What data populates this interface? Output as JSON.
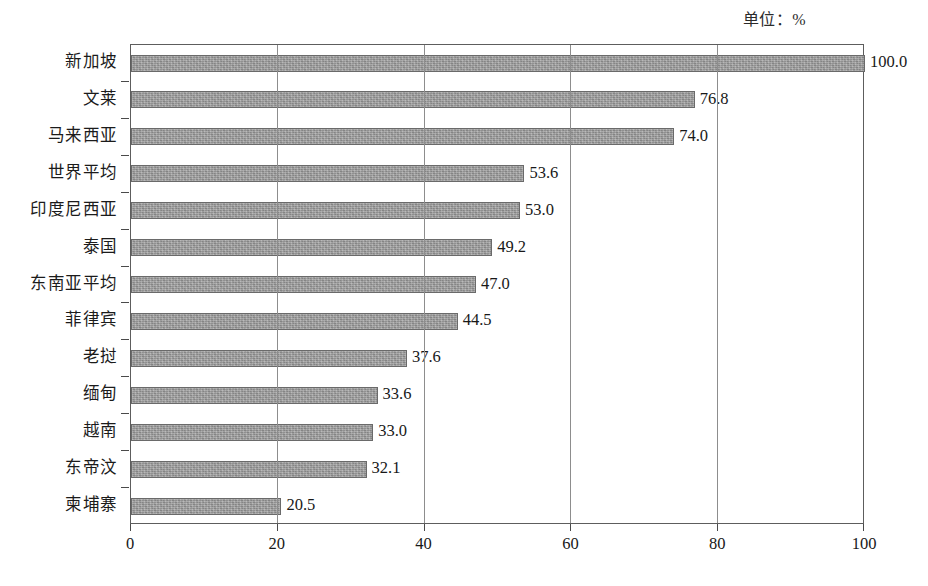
{
  "chart_data": {
    "type": "bar",
    "orientation": "horizontal",
    "title": "",
    "subtitle": "",
    "unit_annotation": "单位：%",
    "xlabel": "",
    "ylabel": "",
    "xlim": [
      0,
      100
    ],
    "xticks": [
      "0",
      "20",
      "40",
      "60",
      "80",
      "100"
    ],
    "xtick_values": [
      0,
      20,
      40,
      60,
      80,
      100
    ],
    "gridlines": [
      20,
      40,
      60,
      80
    ],
    "grid": true,
    "legend": "none",
    "categories": [
      "新加坡",
      "文莱",
      "马来西亚",
      "世界平均",
      "印度尼西亚",
      "泰国",
      "东南亚平均",
      "菲律宾",
      "老挝",
      "缅甸",
      "越南",
      "东帝汶",
      "柬埔寨"
    ],
    "values": [
      100.0,
      76.8,
      74.0,
      53.6,
      53.0,
      49.2,
      47.0,
      44.5,
      37.6,
      33.6,
      33.0,
      32.1,
      20.5
    ],
    "value_labels": [
      "100.0",
      "76.8",
      "74.0",
      "53.6",
      "53.0",
      "49.2",
      "47.0",
      "44.5",
      "37.6",
      "33.6",
      "33.0",
      "32.1",
      "20.5"
    ],
    "series": [
      {
        "name": "",
        "values": [
          100.0,
          76.8,
          74.0,
          53.6,
          53.0,
          49.2,
          47.0,
          44.5,
          37.6,
          33.6,
          33.0,
          32.1,
          20.5
        ]
      }
    ],
    "bar_color": "#9c9c9c",
    "bar_border_color": "#6a6a6a",
    "axis_color": "#5d5d5d",
    "grid_color": "#8d8d8d",
    "background": "#ffffff"
  },
  "footer": {
    "artifact_text": ""
  }
}
